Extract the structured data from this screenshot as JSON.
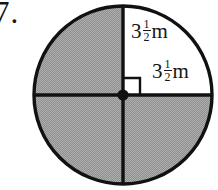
{
  "problem": {
    "number": "7."
  },
  "figure": {
    "name": "shaded-circle-three-quadrants",
    "shape": "circle",
    "center_dot": true,
    "right_angle_marker": true,
    "quadrants": [
      {
        "name": "top-left",
        "shaded": true
      },
      {
        "name": "top-right",
        "shaded": false
      },
      {
        "name": "bottom-left",
        "shaded": true
      },
      {
        "name": "bottom-right",
        "shaded": true
      }
    ],
    "labels": {
      "vertical_radius": {
        "whole": "3",
        "numerator": "1",
        "denominator": "2",
        "unit": "m",
        "plain": "3 1/2 m"
      },
      "horizontal_radius": {
        "whole": "3",
        "numerator": "1",
        "denominator": "2",
        "unit": "m",
        "plain": "3 1/2 m"
      }
    },
    "colors": {
      "shade": "#9a9a9a",
      "outline": "#111111",
      "background": "#ffffff",
      "text": "#161616"
    }
  }
}
